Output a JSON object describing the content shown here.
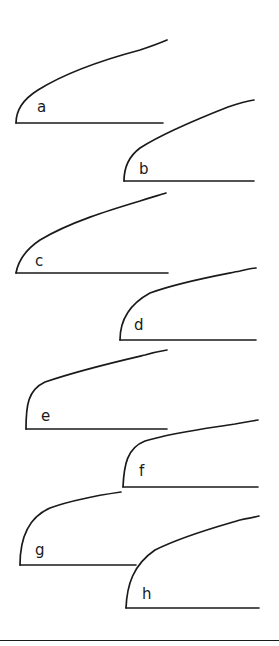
{
  "figure": {
    "stroke_color": "#1a1a1a",
    "background_color": "#ffffff",
    "panels": [
      {
        "label": "a",
        "label_pos": [
          37,
          100
        ],
        "baseline": [
          16,
          123,
          163,
          123
        ],
        "curve": "M16,123 C16,112 22,100 38,90 C70,70 110,58 140,50 C152,46 160,43 167,40"
      },
      {
        "label": "b",
        "label_pos": [
          139,
          162
        ],
        "baseline": [
          124,
          181,
          254,
          181
        ],
        "curve": "M124,181 C124,168 128,157 140,148 C165,132 200,118 228,107 C240,103 248,101 254,100"
      },
      {
        "label": "c",
        "label_pos": [
          35,
          254
        ],
        "baseline": [
          16,
          273,
          168,
          273
        ],
        "curve": "M16,273 C18,262 25,250 40,240 C70,222 110,210 140,201 C152,197 160,195 166,193"
      },
      {
        "label": "d",
        "label_pos": [
          134,
          318
        ],
        "baseline": [
          120,
          340,
          256,
          340
        ],
        "curve": "M120,340 C120,322 128,305 150,293 C180,282 215,276 240,271 C248,269 252,268 256,268"
      },
      {
        "label": "e",
        "label_pos": [
          41,
          409
        ],
        "baseline": [
          26,
          429,
          167,
          429
        ],
        "curve": "M26,429 C26,405 28,390 45,382 C80,370 115,362 145,355 C155,352 161,351 167,350"
      },
      {
        "label": "f",
        "label_pos": [
          139,
          464
        ],
        "baseline": [
          123,
          487,
          258,
          487
        ],
        "curve": "M123,487 C124,465 127,448 145,441 C175,432 210,428 235,424 C245,422 252,421 258,420"
      },
      {
        "label": "g",
        "label_pos": [
          35,
          543
        ],
        "baseline": [
          20,
          565,
          136,
          565
        ],
        "curve": "M20,565 C20,540 27,518 50,508 C75,499 100,495 121,492"
      },
      {
        "label": "h",
        "label_pos": [
          142,
          587
        ],
        "baseline": [
          126,
          608,
          259,
          608
        ],
        "curve": "M126,608 C127,585 133,565 155,550 C185,535 220,526 240,520 C250,518 255,517 259,516"
      }
    ],
    "bottom_rule": [
      0,
      640,
      279,
      640
    ]
  }
}
